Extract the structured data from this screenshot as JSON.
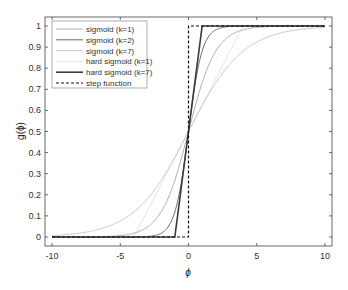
{
  "chart_data": {
    "type": "line",
    "title": "",
    "xlabel": "ϕ",
    "ylabel": "g(ϕ)",
    "xlim": [
      -10.5,
      10.5
    ],
    "ylim": [
      -0.04,
      1.04
    ],
    "xticks": [
      -10,
      -5,
      0,
      5,
      10
    ],
    "yticks": [
      0,
      0.1,
      0.2,
      0.3,
      0.4,
      0.5,
      0.6,
      0.7,
      0.8,
      0.9,
      1
    ],
    "grid": false,
    "legend_position": "upper left",
    "series": [
      {
        "name": "sigmoid (k=1)",
        "function": "1/(1+exp(-x))",
        "color": "#9a9a9a",
        "width": 0.8,
        "style": "solid"
      },
      {
        "name": "sigmoid (k=2)",
        "function": "1/(1+exp(-2x))",
        "color": "#6a6a6a",
        "width": 1,
        "style": "solid"
      },
      {
        "name": "sigmoid (k=7)",
        "function": "1/(1+exp(-x/2))",
        "color": "#c8c8c8",
        "width": 1,
        "style": "solid"
      },
      {
        "name": "hard sigmoid (k=1)",
        "function": "clip(0.5+x/8,0,1)",
        "color": "#e6e6e6",
        "width": 1,
        "style": "solid"
      },
      {
        "name": "hard sigmoid (k=7)",
        "function": "clip(0.5+0.5x,0,1)",
        "color": "#3a3a3a",
        "width": 1.6,
        "style": "solid"
      },
      {
        "name": "step function",
        "function": "x<0?0:1",
        "color": "#111111",
        "width": 1.2,
        "style": "dashed"
      }
    ]
  }
}
